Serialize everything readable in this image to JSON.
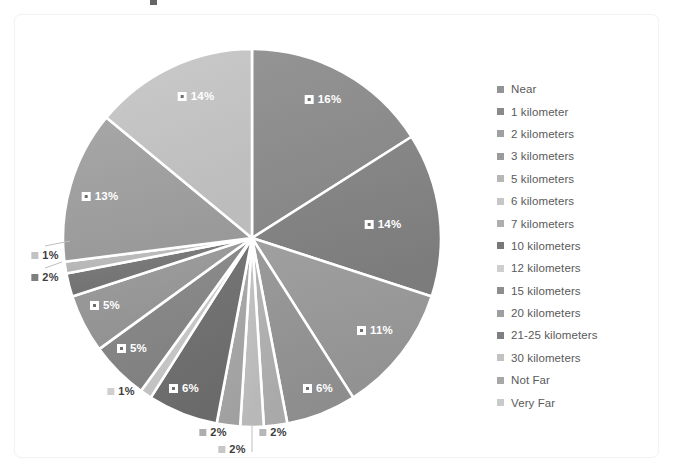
{
  "chart_data": {
    "type": "pie",
    "title": "",
    "legend_position": "right",
    "categories": [
      "Near",
      "1 kilometer",
      "2 kilometers",
      "3 kilometers",
      "5 kilometers",
      "6 kilometers",
      "7 kilometers",
      "10 kilometers",
      "12 kilometers",
      "15 kilometers",
      "20 kilometers",
      "21-25 kilometers",
      "30 kilometers",
      "Not Far",
      "Very Far"
    ],
    "values": [
      16,
      14,
      11,
      6,
      2,
      2,
      2,
      6,
      1,
      5,
      5,
      2,
      1,
      13,
      14
    ],
    "value_labels": [
      "16%",
      "14%",
      "11%",
      "6%",
      "2%",
      "2%",
      "2%",
      "6%",
      "1%",
      "5%",
      "5%",
      "2%",
      "1%",
      "13%",
      "14%"
    ],
    "colors": [
      "#949494",
      "#8a8a8a",
      "#a0a0a0",
      "#9b9b9b",
      "#b7b7b7",
      "#c6c6c6",
      "#aeaeae",
      "#787878",
      "#cfcfcf",
      "#8e8e8e",
      "#9f9f9f",
      "#7f7f7f",
      "#c2c2c2",
      "#a7a7a7",
      "#cacaca"
    ],
    "slice_separator_color": "#ffffff",
    "background": "#ffffff"
  },
  "slices": [
    {
      "label": "16%",
      "category": "Near",
      "value": 16,
      "color": "#949494",
      "lx": 323,
      "ly": 99,
      "style": "light"
    },
    {
      "label": "14%",
      "category": "1 kilometer",
      "value": 14,
      "color": "#8a8a8a",
      "lx": 383,
      "ly": 224,
      "style": "light"
    },
    {
      "label": "11%",
      "category": "2 kilometers",
      "value": 11,
      "color": "#a0a0a0",
      "lx": 375,
      "ly": 330,
      "style": "light"
    },
    {
      "label": "6%",
      "category": "3 kilometers",
      "value": 6,
      "color": "#9b9b9b",
      "lx": 318,
      "ly": 388,
      "style": "light"
    },
    {
      "label": "2%",
      "category": "5 kilometers",
      "value": 2,
      "color": "#b7b7b7",
      "lx": 273,
      "ly": 432,
      "style": "dark"
    },
    {
      "label": "2%",
      "category": "6 kilometers",
      "value": 2,
      "color": "#c6c6c6",
      "lx": 232,
      "ly": 449,
      "style": "dark"
    },
    {
      "label": "2%",
      "category": "7 kilometers",
      "value": 2,
      "color": "#aeaeae",
      "lx": 213,
      "ly": 432,
      "style": "dark"
    },
    {
      "label": "6%",
      "category": "10 kilometers",
      "value": 6,
      "color": "#787878",
      "lx": 184,
      "ly": 388,
      "style": "light"
    },
    {
      "label": "1%",
      "category": "12 kilometers",
      "value": 1,
      "color": "#cfcfcf",
      "lx": 121,
      "ly": 391,
      "style": "dark"
    },
    {
      "label": "5%",
      "category": "15 kilometers",
      "value": 5,
      "color": "#8e8e8e",
      "lx": 132,
      "ly": 348,
      "style": "light"
    },
    {
      "label": "5%",
      "category": "20 kilometers",
      "value": 5,
      "color": "#9f9f9f",
      "lx": 105,
      "ly": 305,
      "style": "light"
    },
    {
      "label": "2%",
      "category": "21-25 kilometers",
      "value": 2,
      "color": "#7f7f7f",
      "lx": 45,
      "ly": 277,
      "style": "dark"
    },
    {
      "label": "1%",
      "category": "30 kilometers",
      "value": 1,
      "color": "#c2c2c2",
      "lx": 45,
      "ly": 255,
      "style": "dark"
    },
    {
      "label": "13%",
      "category": "Not Far",
      "value": 13,
      "color": "#a7a7a7",
      "lx": 100,
      "ly": 196,
      "style": "light"
    },
    {
      "label": "14%",
      "category": "Very Far",
      "value": 14,
      "color": "#cacaca",
      "lx": 196,
      "ly": 96,
      "style": "light"
    }
  ],
  "legend": {
    "items": [
      {
        "label": "Near",
        "color": "#949494"
      },
      {
        "label": "1 kilometer",
        "color": "#8a8a8a"
      },
      {
        "label": "2 kilometers",
        "color": "#a0a0a0"
      },
      {
        "label": "3 kilometers",
        "color": "#9b9b9b"
      },
      {
        "label": "5 kilometers",
        "color": "#b7b7b7"
      },
      {
        "label": "6 kilometers",
        "color": "#c6c6c6"
      },
      {
        "label": "7 kilometers",
        "color": "#aeaeae"
      },
      {
        "label": "10 kilometers",
        "color": "#787878"
      },
      {
        "label": "12 kilometers",
        "color": "#cfcfcf"
      },
      {
        "label": "15 kilometers",
        "color": "#8e8e8e"
      },
      {
        "label": "20 kilometers",
        "color": "#9f9f9f"
      },
      {
        "label": "21-25 kilometers",
        "color": "#7f7f7f"
      },
      {
        "label": "30 kilometers",
        "color": "#c2c2c2"
      },
      {
        "label": "Not Far",
        "color": "#a7a7a7"
      },
      {
        "label": "Very Far",
        "color": "#cacaca"
      }
    ]
  },
  "geometry": {
    "cx": 252,
    "cy": 238,
    "r": 189
  }
}
